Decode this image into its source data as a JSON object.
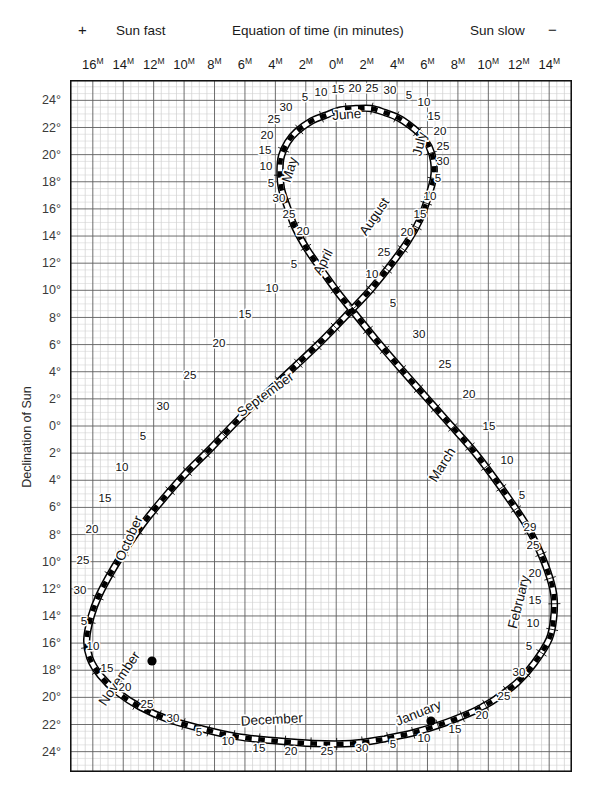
{
  "header": {
    "plus_sign": "+",
    "sun_fast": "Sun fast",
    "title": "Equation of time (in minutes)",
    "sun_slow": "Sun slow",
    "minus_sign": "−"
  },
  "axes": {
    "x_axis_unit": "M",
    "x_axis_ticks": [
      {
        "label": "16",
        "minutes": 16
      },
      {
        "label": "14",
        "minutes": 14
      },
      {
        "label": "12",
        "minutes": 12
      },
      {
        "label": "10",
        "minutes": 10
      },
      {
        "label": "8",
        "minutes": 8
      },
      {
        "label": "6",
        "minutes": 6
      },
      {
        "label": "4",
        "minutes": 4
      },
      {
        "label": "2",
        "minutes": 2
      },
      {
        "label": "0",
        "minutes": 0
      },
      {
        "label": "2",
        "minutes": -2
      },
      {
        "label": "4",
        "minutes": -4
      },
      {
        "label": "6",
        "minutes": -6
      },
      {
        "label": "8",
        "minutes": -8
      },
      {
        "label": "10",
        "minutes": -10
      },
      {
        "label": "12",
        "minutes": -12
      },
      {
        "label": "14",
        "minutes": -14
      }
    ],
    "y_axis_title": "Declination of Sun",
    "y_axis_ticks": [
      {
        "label": "24°",
        "deg": 24
      },
      {
        "label": "22°",
        "deg": 22
      },
      {
        "label": "20°",
        "deg": 20
      },
      {
        "label": "18°",
        "deg": 18
      },
      {
        "label": "16°",
        "deg": 16
      },
      {
        "label": "14°",
        "deg": 14
      },
      {
        "label": "12°",
        "deg": 12
      },
      {
        "label": "10°",
        "deg": 10
      },
      {
        "label": "8°",
        "deg": 8
      },
      {
        "label": "6°",
        "deg": 6
      },
      {
        "label": "4°",
        "deg": 4
      },
      {
        "label": "2°",
        "deg": 2
      },
      {
        "label": "0°",
        "deg": 0
      },
      {
        "label": "2°",
        "deg": -2
      },
      {
        "label": "4°",
        "deg": -4
      },
      {
        "label": "6°",
        "deg": -6
      },
      {
        "label": "8°",
        "deg": -8
      },
      {
        "label": "10°",
        "deg": -10
      },
      {
        "label": "12°",
        "deg": -12
      },
      {
        "label": "14°",
        "deg": -14
      },
      {
        "label": "16°",
        "deg": -16
      },
      {
        "label": "18°",
        "deg": -18
      },
      {
        "label": "20°",
        "deg": -20
      },
      {
        "label": "22°",
        "deg": -22
      },
      {
        "label": "24°",
        "deg": -24
      }
    ]
  },
  "chart_data": {
    "type": "line",
    "title": "Equation of time (in minutes)",
    "xlabel": "Equation of time (in minutes)",
    "ylabel": "Declination of Sun",
    "xlim": [
      17.5,
      -15.5
    ],
    "ylim": [
      -25.5,
      25.5
    ],
    "grid": true,
    "grid_minor_minutes": 0.5,
    "grid_major_minutes": 2,
    "grid_minor_degrees": 0.5,
    "grid_major_degrees": 2,
    "x_axis_direction": "sun-fast-positive-on-left",
    "curve_name": "analemma",
    "series": [
      {
        "name": "analemma",
        "description": "Equation of time (minutes, + = sun fast) versus declination of Sun (degrees), sampled every 5 days through the year.",
        "points": [
          {
            "date": "Jan 1",
            "eot": -3.4,
            "dec": -23.0
          },
          {
            "date": "Jan 5",
            "eot": -5.1,
            "dec": -22.6
          },
          {
            "date": "Jan 10",
            "eot": -7.1,
            "dec": -21.9
          },
          {
            "date": "Jan 15",
            "eot": -8.9,
            "dec": -21.1
          },
          {
            "date": "Jan 17",
            "eot": -9.6,
            "dec": -20.7
          },
          {
            "date": "Jan 20",
            "eot": -10.5,
            "dec": -20.1
          },
          {
            "date": "Jan 25",
            "eot": -11.9,
            "dec": -18.9
          },
          {
            "date": "Jan 30",
            "eot": -13.0,
            "dec": -17.5
          },
          {
            "date": "Feb 5",
            "eot": -14.0,
            "dec": -15.7
          },
          {
            "date": "Feb 10",
            "eot": -14.3,
            "dec": -14.1
          },
          {
            "date": "Feb 15",
            "eot": -14.3,
            "dec": -12.4
          },
          {
            "date": "Feb 20",
            "eot": -13.9,
            "dec": -10.7
          },
          {
            "date": "Feb 25",
            "eot": -13.2,
            "dec": -8.8
          },
          {
            "date": "Feb 29",
            "eot": -12.5,
            "dec": -7.3
          },
          {
            "date": "Mar 5",
            "eot": -11.5,
            "dec": -5.6
          },
          {
            "date": "Mar 10",
            "eot": -10.3,
            "dec": -3.7
          },
          {
            "date": "Mar 15",
            "eot": -9.0,
            "dec": -1.8
          },
          {
            "date": "Mar 20",
            "eot": -7.5,
            "dec": 0.1
          },
          {
            "date": "Mar 25",
            "eot": -6.0,
            "dec": 2.0
          },
          {
            "date": "Mar 30",
            "eot": -4.5,
            "dec": 3.9
          },
          {
            "date": "Apr 5",
            "eot": -2.8,
            "dec": 6.1
          },
          {
            "date": "Apr 10",
            "eot": -1.5,
            "dec": 7.9
          },
          {
            "date": "Apr 15",
            "eot": -0.2,
            "dec": 9.7
          },
          {
            "date": "Apr 20",
            "eot": 0.9,
            "dec": 11.4
          },
          {
            "date": "Apr 25",
            "eot": 1.9,
            "dec": 13.0
          },
          {
            "date": "Apr 30",
            "eot": 2.7,
            "dec": 14.6
          },
          {
            "date": "May 5",
            "eot": 3.2,
            "dec": 16.1
          },
          {
            "date": "May 10",
            "eot": 3.6,
            "dec": 17.5
          },
          {
            "date": "May 15",
            "eot": 3.7,
            "dec": 18.8
          },
          {
            "date": "May 20",
            "eot": 3.6,
            "dec": 19.9
          },
          {
            "date": "May 25",
            "eot": 3.2,
            "dec": 20.9
          },
          {
            "date": "May 30",
            "eot": 2.6,
            "dec": 21.7
          },
          {
            "date": "Jun 5",
            "eot": 1.6,
            "dec": 22.5
          },
          {
            "date": "Jun 10",
            "eot": 0.7,
            "dec": 22.9
          },
          {
            "date": "Jun 15",
            "eot": -0.3,
            "dec": 23.3
          },
          {
            "date": "Jun 20",
            "eot": -1.3,
            "dec": 23.4
          },
          {
            "date": "Jun 25",
            "eot": -2.3,
            "dec": 23.4
          },
          {
            "date": "Jun 30",
            "eot": -3.2,
            "dec": 23.1
          },
          {
            "date": "Jul 5",
            "eot": -4.1,
            "dec": 22.7
          },
          {
            "date": "Jul 10",
            "eot": -4.9,
            "dec": 22.1
          },
          {
            "date": "Jul 15",
            "eot": -5.6,
            "dec": 21.4
          },
          {
            "date": "Jul 20",
            "eot": -6.1,
            "dec": 20.6
          },
          {
            "date": "Jul 25",
            "eot": -6.4,
            "dec": 19.5
          },
          {
            "date": "Jul 30",
            "eot": -6.4,
            "dec": 18.3
          },
          {
            "date": "Aug 5",
            "eot": -6.0,
            "dec": 16.7
          },
          {
            "date": "Aug 10",
            "eot": -5.5,
            "dec": 15.2
          },
          {
            "date": "Aug 15",
            "eot": -4.7,
            "dec": 13.6
          },
          {
            "date": "Aug 20",
            "eot": -3.6,
            "dec": 11.9
          },
          {
            "date": "Aug 25",
            "eot": -2.3,
            "dec": 10.1
          },
          {
            "date": "Aug 30",
            "eot": -0.8,
            "dec": 8.3
          },
          {
            "date": "Sep 5",
            "eot": 1.1,
            "dec": 6.1
          },
          {
            "date": "Sep 10",
            "eot": 2.9,
            "dec": 4.2
          },
          {
            "date": "Sep 15",
            "eot": 4.7,
            "dec": 2.3
          },
          {
            "date": "Sep 20",
            "eot": 6.5,
            "dec": 0.4
          },
          {
            "date": "Sep 25",
            "eot": 8.2,
            "dec": -1.6
          },
          {
            "date": "Sep 30",
            "eot": 9.9,
            "dec": -3.5
          },
          {
            "date": "Oct 5",
            "eot": 11.4,
            "dec": -5.4
          },
          {
            "date": "Oct 10",
            "eot": 12.7,
            "dec": -7.2
          },
          {
            "date": "Oct 15",
            "eot": 13.8,
            "dec": -9.0
          },
          {
            "date": "Oct 20",
            "eot": 14.8,
            "dec": -10.8
          },
          {
            "date": "Oct 25",
            "eot": 15.6,
            "dec": -12.5
          },
          {
            "date": "Oct 30",
            "eot": 16.1,
            "dec": -14.0
          },
          {
            "date": "Nov 5",
            "eot": 16.4,
            "dec": -15.7
          },
          {
            "date": "Nov 10",
            "eot": 16.2,
            "dec": -17.1
          },
          {
            "date": "Nov 15",
            "eot": 15.5,
            "dec": -18.4
          },
          {
            "date": "Nov 20",
            "eot": 14.4,
            "dec": -19.6
          },
          {
            "date": "Nov 25",
            "eot": 12.9,
            "dec": -20.7
          },
          {
            "date": "Nov 30",
            "eot": 11.1,
            "dec": -21.6
          },
          {
            "date": "Dec 5",
            "eot": 8.9,
            "dec": -22.3
          },
          {
            "date": "Dec 10",
            "eot": 6.5,
            "dec": -22.9
          },
          {
            "date": "Dec 15",
            "eot": 4.0,
            "dec": -23.2
          },
          {
            "date": "Dec 20",
            "eot": 1.5,
            "dec": -23.4
          },
          {
            "date": "Dec 25",
            "eot": -1.0,
            "dec": -23.4
          },
          {
            "date": "Dec 30",
            "eot": -3.0,
            "dec": -23.1
          }
        ]
      }
    ],
    "month_labels": [
      {
        "name": "January",
        "x": 420,
        "y": 717,
        "rot": -22
      },
      {
        "name": "February",
        "x": 523,
        "y": 603,
        "rot": -76
      },
      {
        "name": "March",
        "x": 446,
        "y": 467,
        "rot": -58
      },
      {
        "name": "April",
        "x": 327,
        "y": 264,
        "rot": -63
      },
      {
        "name": "May",
        "x": 294,
        "y": 171,
        "rot": -73
      },
      {
        "name": "June",
        "x": 347,
        "y": 119,
        "rot": -4
      },
      {
        "name": "July",
        "x": 424,
        "y": 145,
        "rot": -76
      },
      {
        "name": "August",
        "x": 378,
        "y": 219,
        "rot": -56
      },
      {
        "name": "September",
        "x": 268,
        "y": 398,
        "rot": -36
      },
      {
        "name": "October",
        "x": 133,
        "y": 540,
        "rot": -66
      },
      {
        "name": "November",
        "x": 123,
        "y": 681,
        "rot": -56
      },
      {
        "name": "December",
        "x": 272,
        "y": 724,
        "rot": -3
      }
    ],
    "day_labels": [
      {
        "text": "15",
        "x": 338,
        "y": 93
      },
      {
        "text": "20",
        "x": 355,
        "y": 92
      },
      {
        "text": "25",
        "x": 372,
        "y": 92
      },
      {
        "text": "30",
        "x": 390,
        "y": 94
      },
      {
        "text": "10",
        "x": 321,
        "y": 96
      },
      {
        "text": "5",
        "x": 305,
        "y": 101
      },
      {
        "text": "5",
        "x": 409,
        "y": 99
      },
      {
        "text": "10",
        "x": 424,
        "y": 106
      },
      {
        "text": "30",
        "x": 286,
        "y": 111
      },
      {
        "text": "15",
        "x": 434,
        "y": 120
      },
      {
        "text": "25",
        "x": 274,
        "y": 123
      },
      {
        "text": "20",
        "x": 440,
        "y": 135
      },
      {
        "text": "20",
        "x": 267,
        "y": 139
      },
      {
        "text": "25",
        "x": 443,
        "y": 150
      },
      {
        "text": "15",
        "x": 265,
        "y": 154
      },
      {
        "text": "30",
        "x": 443,
        "y": 165
      },
      {
        "text": "10",
        "x": 266,
        "y": 170
      },
      {
        "text": "5",
        "x": 271,
        "y": 187
      },
      {
        "text": "5",
        "x": 438,
        "y": 182
      },
      {
        "text": "30",
        "x": 279,
        "y": 202
      },
      {
        "text": "10",
        "x": 430,
        "y": 200
      },
      {
        "text": "25",
        "x": 289,
        "y": 218
      },
      {
        "text": "15",
        "x": 420,
        "y": 218
      },
      {
        "text": "20",
        "x": 303,
        "y": 235
      },
      {
        "text": "20",
        "x": 407,
        "y": 236
      },
      {
        "text": "25",
        "x": 384,
        "y": 256
      },
      {
        "text": "5",
        "x": 294,
        "y": 268
      },
      {
        "text": "10",
        "x": 372,
        "y": 278
      },
      {
        "text": "10",
        "x": 272,
        "y": 292
      },
      {
        "text": "5",
        "x": 393,
        "y": 307
      },
      {
        "text": "15",
        "x": 245,
        "y": 318
      },
      {
        "text": "30",
        "x": 419,
        "y": 338
      },
      {
        "text": "20",
        "x": 219,
        "y": 347
      },
      {
        "text": "25",
        "x": 445,
        "y": 368
      },
      {
        "text": "25",
        "x": 190,
        "y": 379
      },
      {
        "text": "20",
        "x": 469,
        "y": 398
      },
      {
        "text": "30",
        "x": 163,
        "y": 410
      },
      {
        "text": "15",
        "x": 489,
        "y": 430
      },
      {
        "text": "5",
        "x": 143,
        "y": 440
      },
      {
        "text": "10",
        "x": 507,
        "y": 464
      },
      {
        "text": "10",
        "x": 122,
        "y": 471
      },
      {
        "text": "5",
        "x": 522,
        "y": 499
      },
      {
        "text": "15",
        "x": 105,
        "y": 502
      },
      {
        "text": "29",
        "x": 530,
        "y": 531
      },
      {
        "text": "20",
        "x": 92,
        "y": 533
      },
      {
        "text": "25",
        "x": 533,
        "y": 549
      },
      {
        "text": "25",
        "x": 83,
        "y": 564
      },
      {
        "text": "20",
        "x": 535,
        "y": 577
      },
      {
        "text": "30",
        "x": 80,
        "y": 594
      },
      {
        "text": "15",
        "x": 535,
        "y": 604
      },
      {
        "text": "5",
        "x": 84,
        "y": 625
      },
      {
        "text": "10",
        "x": 533,
        "y": 627
      },
      {
        "text": "10",
        "x": 93,
        "y": 650
      },
      {
        "text": "5",
        "x": 529,
        "y": 650
      },
      {
        "text": "15",
        "x": 107,
        "y": 672
      },
      {
        "text": "30",
        "x": 519,
        "y": 676
      },
      {
        "text": "20",
        "x": 125,
        "y": 691
      },
      {
        "text": "25",
        "x": 504,
        "y": 700
      },
      {
        "text": "25",
        "x": 147,
        "y": 708
      },
      {
        "text": "20",
        "x": 482,
        "y": 719
      },
      {
        "text": "30",
        "x": 173,
        "y": 722
      },
      {
        "text": "15",
        "x": 455,
        "y": 733
      },
      {
        "text": "5",
        "x": 199,
        "y": 736
      },
      {
        "text": "10",
        "x": 424,
        "y": 742
      },
      {
        "text": "10",
        "x": 228,
        "y": 745
      },
      {
        "text": "5",
        "x": 393,
        "y": 748
      },
      {
        "text": "15",
        "x": 259,
        "y": 752
      },
      {
        "text": "30",
        "x": 362,
        "y": 752
      },
      {
        "text": "20",
        "x": 291,
        "y": 755
      },
      {
        "text": "25",
        "x": 327,
        "y": 755
      }
    ],
    "marker_dots": [
      {
        "label": "November marker",
        "x": 152,
        "y": 661
      },
      {
        "label": "January marker",
        "x": 431,
        "y": 721
      }
    ]
  }
}
